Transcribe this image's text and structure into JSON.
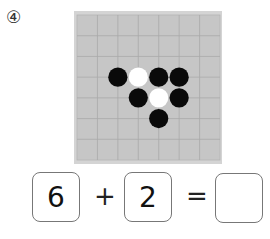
{
  "question": {
    "number_label": "④"
  },
  "board": {
    "cols": 7,
    "rows": 7,
    "fill_color": "#c6c6c6",
    "border_color": "#d4d4d4",
    "line_color": "#a9a9a9",
    "stones": [
      {
        "x": 2,
        "y": 3,
        "color": "black"
      },
      {
        "x": 3,
        "y": 3,
        "color": "white"
      },
      {
        "x": 4,
        "y": 3,
        "color": "black"
      },
      {
        "x": 5,
        "y": 3,
        "color": "black"
      },
      {
        "x": 3,
        "y": 4,
        "color": "black"
      },
      {
        "x": 4,
        "y": 4,
        "color": "white"
      },
      {
        "x": 5,
        "y": 4,
        "color": "black"
      },
      {
        "x": 4,
        "y": 5,
        "color": "black"
      }
    ],
    "black_count": 6,
    "white_count": 2
  },
  "equation": {
    "first": "6",
    "plus": "+",
    "second": "2",
    "equals": "=",
    "answer": ""
  }
}
